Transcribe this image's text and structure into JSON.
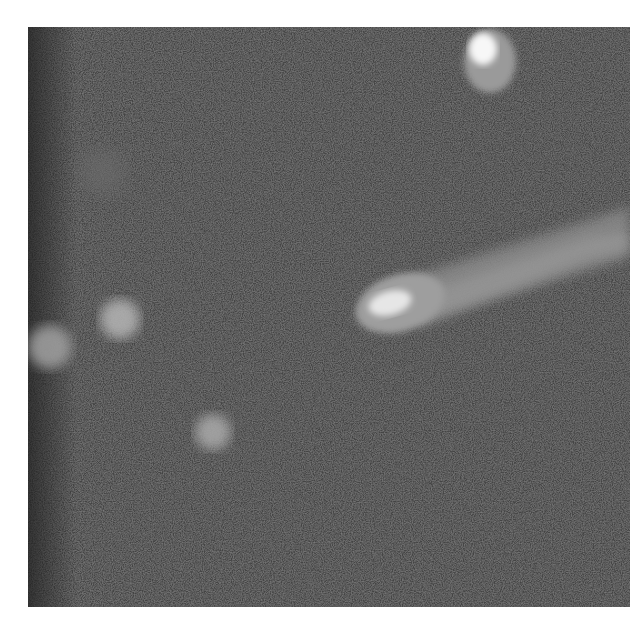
{
  "image": {
    "description": "Grayscale noisy photograph of a comet with a bright head and diffuse tail on a dark speckled background, with several fuzzy blobs",
    "background_color": "#3a3a3a",
    "frame": {
      "x": 28,
      "y": 27,
      "width": 602,
      "height": 580
    },
    "objects": [
      {
        "name": "comet-head",
        "cx": 365,
        "cy": 273,
        "rx": 40,
        "ry": 26,
        "color": "#cfcfcf"
      },
      {
        "name": "comet-tail",
        "from": [
          345,
          285
        ],
        "to": [
          602,
          200
        ],
        "color": "#8f8f8f"
      },
      {
        "name": "top-bright-object",
        "cx": 460,
        "cy": 30,
        "rx": 25,
        "ry": 32,
        "color": "#f2f2f2"
      },
      {
        "name": "left-blob-1",
        "cx": 92,
        "cy": 292,
        "r": 22,
        "color": "#a8a8a8"
      },
      {
        "name": "left-blob-2",
        "cx": 25,
        "cy": 320,
        "r": 24,
        "color": "#9a9a9a"
      },
      {
        "name": "lower-blob",
        "cx": 185,
        "cy": 405,
        "r": 20,
        "color": "#a0a0a0"
      },
      {
        "name": "faint-blob",
        "cx": 75,
        "cy": 145,
        "r": 22,
        "color": "#6a6a6a"
      }
    ]
  }
}
